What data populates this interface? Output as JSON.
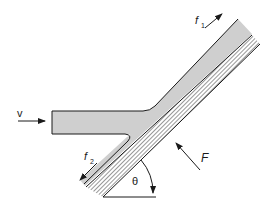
{
  "diagram": {
    "colors": {
      "fluid": "#cfcfcf",
      "line": "#1a1a1a",
      "background": "#ffffff"
    },
    "labels": {
      "velocity": "v",
      "flow1": "f",
      "flow1_sub": "1",
      "flow2": "f",
      "flow2_sub": "2",
      "force": "F",
      "angle": "θ"
    }
  }
}
